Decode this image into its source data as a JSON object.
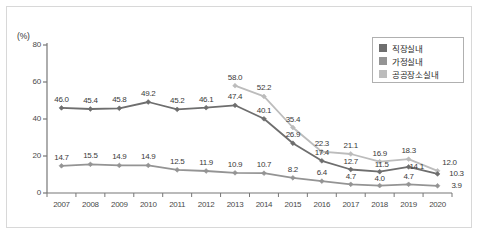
{
  "chart_data": {
    "type": "line",
    "title": "",
    "xlabel": "",
    "ylabel": "(%)",
    "unit_label": "(%)",
    "ylim": [
      0,
      80
    ],
    "yticks": [
      0,
      20,
      40,
      60,
      80
    ],
    "ytick_labels": [
      "0",
      "20",
      "40",
      "60",
      "80"
    ],
    "grid": false,
    "legend_position": "top-right",
    "categories": [
      "2007",
      "2008",
      "2009",
      "2010",
      "2011",
      "2012",
      "2013",
      "2014",
      "2015",
      "2016",
      "2017",
      "2018",
      "2019",
      "2020"
    ],
    "series": [
      {
        "name": "직장실내",
        "color": "#6e6e6e",
        "values": [
          46.0,
          45.4,
          45.8,
          49.2,
          45.2,
          46.1,
          47.4,
          40.1,
          26.9,
          17.4,
          12.7,
          11.5,
          14.1,
          10.3
        ],
        "labels": [
          "46.0",
          "45.4",
          "45.8",
          "49.2",
          "45.2",
          "46.1",
          "47.4",
          "40.1",
          "26.9",
          "17.4",
          "12.7",
          "11.5",
          "14.1",
          "10.3"
        ]
      },
      {
        "name": "가정실내",
        "color": "#949494",
        "values": [
          14.7,
          15.5,
          14.9,
          14.9,
          12.5,
          11.9,
          10.9,
          10.7,
          8.2,
          6.4,
          4.7,
          4.0,
          4.7,
          3.9
        ],
        "labels": [
          "14.7",
          "15.5",
          "14.9",
          "14.9",
          "12.5",
          "11.9",
          "10.9",
          "10.7",
          "8.2",
          "6.4",
          "4.7",
          "4.0",
          "4.7",
          "3.9"
        ]
      },
      {
        "name": "공공장소실내",
        "color": "#bcbcbc",
        "values": [
          null,
          null,
          null,
          null,
          null,
          null,
          58.0,
          52.2,
          35.4,
          22.3,
          21.1,
          16.9,
          18.3,
          12.0
        ],
        "labels": [
          "",
          "",
          "",
          "",
          "",
          "",
          "58.0",
          "52.2",
          "35.4",
          "22.3",
          "21.1",
          "16.9",
          "18.3",
          "12.0"
        ]
      }
    ]
  },
  "legend": {
    "items": [
      {
        "label": "직장실내",
        "color": "#6e6e6e"
      },
      {
        "label": "가정실내",
        "color": "#949494"
      },
      {
        "label": "공공장소실내",
        "color": "#bcbcbc"
      }
    ]
  },
  "axes": {
    "y_unit": "(%)",
    "y_tick_labels": [
      "80",
      "60",
      "40",
      "20",
      "0"
    ],
    "x_tick_labels": [
      "2007",
      "2008",
      "2009",
      "2010",
      "2011",
      "2012",
      "2013",
      "2014",
      "2015",
      "2016",
      "2017",
      "2018",
      "2019",
      "2020"
    ]
  },
  "colors": {
    "axis": "#777777",
    "frame": "#d8d8d8",
    "background": "#ffffff",
    "series_dark": "#6e6e6e",
    "series_mid": "#949494",
    "series_light": "#bcbcbc"
  }
}
